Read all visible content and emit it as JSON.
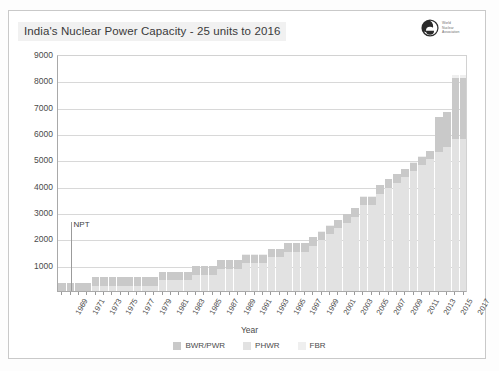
{
  "header": {
    "title": "India's Nuclear Power Capacity - 25 units to 2016",
    "logo_name": "world-nuclear-association-logo",
    "logo_text": "World\nNuclear\nAssociation"
  },
  "colors": {
    "bwrpwr": "#c9c9c9",
    "phwr": "#e2e2e2",
    "fbr": "#efefef",
    "grid": "#d8d8d8",
    "axis": "#a9a9a9",
    "text": "#4a4a4a"
  },
  "annotation": {
    "npt_label": "NPT",
    "npt_year": 1970
  },
  "chart_data": {
    "type": "bar",
    "stacked": true,
    "title": "India's Nuclear Power Capacity - 25 units to 2016",
    "xlabel": "Year",
    "ylabel": "Net MWe",
    "ylim": [
      0,
      9000
    ],
    "ytick_step": 1000,
    "yticks": [
      0,
      1000,
      2000,
      3000,
      4000,
      5000,
      6000,
      7000,
      8000,
      9000
    ],
    "grid": true,
    "legend_position": "bottom",
    "x": [
      1969,
      1970,
      1971,
      1972,
      1973,
      1974,
      1975,
      1976,
      1977,
      1978,
      1979,
      1980,
      1981,
      1982,
      1983,
      1984,
      1985,
      1986,
      1987,
      1988,
      1989,
      1990,
      1991,
      1992,
      1993,
      1994,
      1995,
      1996,
      1997,
      1998,
      1999,
      2000,
      2001,
      2002,
      2003,
      2004,
      2005,
      2006,
      2007,
      2008,
      2009,
      2010,
      2011,
      2012,
      2013,
      2014,
      2015,
      2016,
      2017
    ],
    "xtick_labels": [
      "1969",
      "1971",
      "1973",
      "1975",
      "1977",
      "1979",
      "1981",
      "1983",
      "1985",
      "1987",
      "1989",
      "1991",
      "1993",
      "1995",
      "1997",
      "1999",
      "2001",
      "2003",
      "2005",
      "2007",
      "2009",
      "2011",
      "2013",
      "2015",
      "2017"
    ],
    "series": [
      {
        "name": "BWR/PWR",
        "color": "#c9c9c9",
        "values": [
          320,
          320,
          320,
          320,
          320,
          320,
          320,
          320,
          320,
          320,
          320,
          320,
          320,
          320,
          320,
          320,
          320,
          320,
          320,
          320,
          320,
          320,
          320,
          320,
          320,
          320,
          320,
          320,
          320,
          320,
          320,
          320,
          320,
          320,
          320,
          320,
          320,
          320,
          320,
          320,
          320,
          320,
          320,
          320,
          320,
          1320,
          1320,
          2320,
          2320
        ]
      },
      {
        "name": "PHWR",
        "color": "#e2e2e2",
        "values": [
          0,
          0,
          0,
          0,
          200,
          200,
          200,
          200,
          200,
          200,
          200,
          200,
          400,
          400,
          400,
          400,
          620,
          620,
          620,
          840,
          840,
          840,
          1060,
          1060,
          1060,
          1280,
          1280,
          1500,
          1500,
          1500,
          1720,
          1940,
          2160,
          2380,
          2600,
          2820,
          3260,
          3260,
          3700,
          3920,
          4120,
          4320,
          4560,
          4780,
          5000,
          5280,
          5480,
          5780,
          5780
        ]
      },
      {
        "name": "FBR",
        "color": "#efefef",
        "values": [
          0,
          0,
          0,
          0,
          0,
          0,
          0,
          0,
          0,
          0,
          0,
          0,
          0,
          0,
          0,
          13,
          13,
          13,
          13,
          13,
          13,
          13,
          13,
          13,
          13,
          13,
          13,
          13,
          13,
          13,
          13,
          13,
          13,
          13,
          13,
          13,
          13,
          13,
          13,
          13,
          13,
          13,
          13,
          13,
          13,
          13,
          13,
          100,
          100
        ]
      }
    ],
    "annotations": [
      {
        "text": "NPT",
        "x": 1970,
        "y": 2600
      }
    ]
  },
  "legend": {
    "items": [
      {
        "label": "BWR/PWR",
        "color": "#c9c9c9"
      },
      {
        "label": "PHWR",
        "color": "#e2e2e2"
      },
      {
        "label": "FBR",
        "color": "#efefef"
      }
    ]
  }
}
